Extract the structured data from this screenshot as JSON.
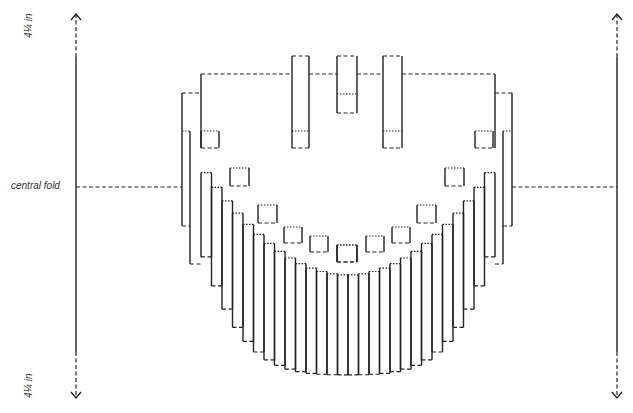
{
  "labels": {
    "central_fold": "central fold",
    "height_top": "4¼ in",
    "height_bottom": "4¼ in"
  },
  "legend_styles": {
    "cut": "solid",
    "mountain_fold": "dashed",
    "valley_fold": "dotted"
  },
  "colors": {
    "line": "#222222",
    "background": "#ffffff"
  },
  "geometry": {
    "left_rule_x": 76,
    "right_rule_x": 617,
    "rule_top": 14,
    "rule_bottom": 398,
    "fold_y": 187,
    "top_bar_y": 74,
    "towers": [
      {
        "x1": 292,
        "x2": 309,
        "y_top": 56,
        "y_bot": 148,
        "valley_y": 131
      },
      {
        "x1": 337,
        "x2": 357,
        "y_top": 56,
        "y_bot": 113,
        "valley_y": 94
      },
      {
        "x1": 383,
        "x2": 402,
        "y_top": 56,
        "y_bot": 148,
        "valley_y": 131
      }
    ]
  }
}
